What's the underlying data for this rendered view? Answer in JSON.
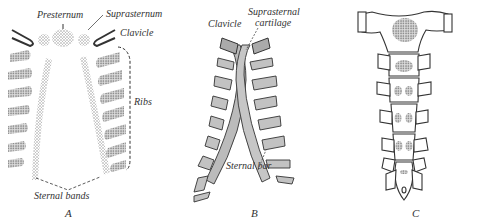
{
  "figure": {
    "panels": [
      {
        "id": "A",
        "letter": "A",
        "labels": {
          "presternum": "Presternum",
          "suprasternum": "Suprasternum",
          "clavicle": "Clavicle",
          "ribs": "Ribs",
          "sternal_bands": "Sternal bands"
        }
      },
      {
        "id": "B",
        "letter": "B",
        "labels": {
          "clavicle": "Clavicle",
          "suprasternal_cartilage_1": "Suprasternal",
          "suprasternal_cartilage_2": "cartilage",
          "sternal_bar": "Sternal bar"
        }
      },
      {
        "id": "C",
        "letter": "C",
        "labels": {}
      }
    ],
    "colors": {
      "ink": "#333333",
      "stipple": "#9a9a9a",
      "bone_fill": "#bdbdbd",
      "background": "#ffffff"
    }
  }
}
